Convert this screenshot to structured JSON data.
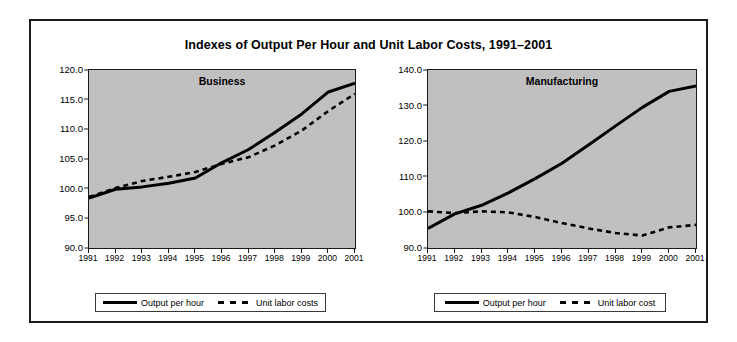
{
  "figure": {
    "title": "Indexes of Output Per Hour and Unit Labor Costs, 1991–2001"
  },
  "chart_data": [
    {
      "type": "line",
      "title": "Business",
      "xlabel": "",
      "ylabel": "",
      "grid": false,
      "legend_position": "bottom",
      "x": [
        1991,
        1992,
        1993,
        1994,
        1995,
        1996,
        1997,
        1998,
        1999,
        2000,
        2001
      ],
      "xticklabels": [
        "1991",
        "1992",
        "1993",
        "1994",
        "1995",
        "1996",
        "1997",
        "1998",
        "1999",
        "2000",
        "2001"
      ],
      "ylim": [
        90.0,
        120.0
      ],
      "yticks": [
        90.0,
        95.0,
        100.0,
        105.0,
        110.0,
        115.0,
        120.0
      ],
      "yticklabels": [
        "90.0",
        "95.0",
        "100.0",
        "105.0",
        "110.0",
        "115.0",
        "120.0"
      ],
      "series": [
        {
          "name": "Output per hour",
          "style": "solid",
          "color": "#000000",
          "values": [
            98.4,
            99.9,
            100.3,
            100.9,
            101.8,
            104.4,
            106.6,
            109.5,
            112.6,
            116.3,
            117.8
          ]
        },
        {
          "name": "Unit labor costs",
          "style": "dashed",
          "color": "#000000",
          "values": [
            98.6,
            100.1,
            101.3,
            102.0,
            102.8,
            104.2,
            105.3,
            107.3,
            109.8,
            113.1,
            116.0
          ]
        }
      ]
    },
    {
      "type": "line",
      "title": "Manufacturing",
      "xlabel": "",
      "ylabel": "",
      "grid": false,
      "legend_position": "bottom",
      "x": [
        1991,
        1992,
        1993,
        1994,
        1995,
        1996,
        1997,
        1998,
        1999,
        2000,
        2001
      ],
      "xticklabels": [
        "1991",
        "1992",
        "1993",
        "1994",
        "1995",
        "1996",
        "1997",
        "1998",
        "1999",
        "2000",
        "2001"
      ],
      "ylim": [
        90.0,
        140.0
      ],
      "yticks": [
        90.0,
        100.0,
        110.0,
        120.0,
        130.0,
        140.0
      ],
      "yticklabels": [
        "90.0",
        "100.0",
        "110.0",
        "120.0",
        "130.0",
        "140.0"
      ],
      "series": [
        {
          "name": "Output per hour",
          "style": "solid",
          "color": "#000000",
          "values": [
            95.5,
            99.6,
            102.0,
            105.5,
            109.5,
            113.8,
            119.0,
            124.3,
            129.5,
            134.0,
            135.5
          ]
        },
        {
          "name": "Unit labor cost",
          "style": "dashed",
          "color": "#000000",
          "values": [
            100.3,
            99.8,
            100.3,
            100.0,
            98.7,
            97.0,
            95.5,
            94.2,
            93.5,
            95.8,
            96.5
          ]
        }
      ]
    }
  ],
  "panels": {
    "business": {
      "label": "Business",
      "legend": {
        "series_1": "Output per hour",
        "series_2": "Unit labor costs"
      }
    },
    "manufacturing": {
      "label": "Manufacturing",
      "legend": {
        "series_1": "Output per hour",
        "series_2": "Unit labor cost"
      }
    }
  }
}
